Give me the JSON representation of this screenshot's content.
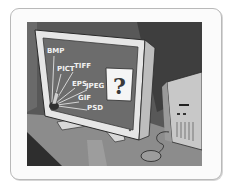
{
  "illustration": {
    "subject": "computer monitor displaying image file formats",
    "formats": [
      "BMP",
      "PICT",
      "TIFF",
      "EPS",
      "JPEG",
      "GIF",
      "PSD"
    ],
    "card_symbol": "?",
    "colors": {
      "wall": "#5a5a5a",
      "screen": "#6e6e6e",
      "bezel": "#e4e4e4",
      "desk": "#8a8a8a",
      "card": "#f5f5f5"
    }
  }
}
